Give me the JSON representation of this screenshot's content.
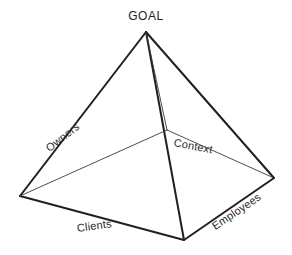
{
  "diagram": {
    "type": "pyramid-3d-line-drawing",
    "background_color": "#ffffff",
    "stroke_color": "#231f20",
    "hidden_edge_color": "#3a3a3c",
    "apex_label": "GOAL",
    "base_labels": {
      "back_left": "Owners",
      "back_right": "Context",
      "front_left": "Clients",
      "front_right": "Employees"
    },
    "vertices": {
      "apex": {
        "x": 146,
        "y": 32
      },
      "base_left": {
        "x": 20,
        "y": 196
      },
      "base_front": {
        "x": 184,
        "y": 240
      },
      "base_right": {
        "x": 274,
        "y": 178
      },
      "base_back": {
        "x": 167,
        "y": 130
      }
    },
    "edges": [
      {
        "name": "apex-to-base-left",
        "style": "thick"
      },
      {
        "name": "apex-to-base-front",
        "style": "thick"
      },
      {
        "name": "apex-to-base-right",
        "style": "thick"
      },
      {
        "name": "apex-to-base-back",
        "style": "thin"
      },
      {
        "name": "base-left-to-base-front",
        "style": "thick"
      },
      {
        "name": "base-front-to-base-right",
        "style": "thick"
      },
      {
        "name": "base-left-to-base-back",
        "style": "thin"
      },
      {
        "name": "base-back-to-base-right",
        "style": "thin"
      }
    ]
  }
}
